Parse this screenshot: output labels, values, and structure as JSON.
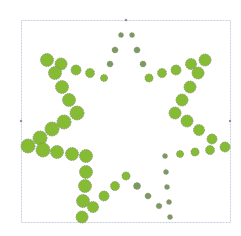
{
  "chart_data": {
    "type": "scatter",
    "title": "",
    "xlabel": "",
    "ylabel": "",
    "grid": false,
    "legend": false,
    "frame": {
      "x": 21,
      "y": 20,
      "width": 209,
      "height": 202,
      "color": "#c8cce0"
    },
    "ticks": [
      {
        "x": 126,
        "y": 20
      },
      {
        "x": 21,
        "y": 121
      },
      {
        "x": 230,
        "y": 121
      }
    ],
    "colors": {
      "large_fill": "#86bc34",
      "large_stroke": "#7a8a6a",
      "small_fill": "#7c9a5a",
      "small_stroke": "#8a8a9a"
    },
    "series": [
      {
        "name": "large",
        "points": [
          {
            "x": 47,
            "y": 60,
            "r": 6.5
          },
          {
            "x": 61,
            "y": 64,
            "r": 6
          },
          {
            "x": 55,
            "y": 73,
            "r": 6.5
          },
          {
            "x": 76,
            "y": 70,
            "r": 5
          },
          {
            "x": 90,
            "y": 73,
            "r": 4.5
          },
          {
            "x": 62,
            "y": 87,
            "r": 6.5
          },
          {
            "x": 69,
            "y": 100,
            "r": 6.5
          },
          {
            "x": 77,
            "y": 113,
            "r": 7
          },
          {
            "x": 64,
            "y": 122,
            "r": 7
          },
          {
            "x": 52,
            "y": 129,
            "r": 7
          },
          {
            "x": 40,
            "y": 138,
            "r": 7
          },
          {
            "x": 28,
            "y": 146,
            "r": 7
          },
          {
            "x": 43,
            "y": 150,
            "r": 7
          },
          {
            "x": 57,
            "y": 152,
            "r": 6.5
          },
          {
            "x": 72,
            "y": 154,
            "r": 6.5
          },
          {
            "x": 86,
            "y": 156,
            "r": 6.5
          },
          {
            "x": 86,
            "y": 172,
            "r": 6.5
          },
          {
            "x": 85,
            "y": 186,
            "r": 6.5
          },
          {
            "x": 83,
            "y": 201,
            "r": 6.5
          },
          {
            "x": 93,
            "y": 207,
            "r": 5.5
          },
          {
            "x": 82,
            "y": 217,
            "r": 6
          },
          {
            "x": 104,
            "y": 196,
            "r": 5
          },
          {
            "x": 115,
            "y": 186,
            "r": 4.5
          },
          {
            "x": 126,
            "y": 176,
            "r": 4
          },
          {
            "x": 205,
            "y": 60,
            "r": 6
          },
          {
            "x": 191,
            "y": 64,
            "r": 5.5
          },
          {
            "x": 198,
            "y": 73,
            "r": 6
          },
          {
            "x": 176,
            "y": 70,
            "r": 5
          },
          {
            "x": 162,
            "y": 73,
            "r": 4.5
          },
          {
            "x": 149,
            "y": 78,
            "r": 4
          },
          {
            "x": 190,
            "y": 87,
            "r": 6
          },
          {
            "x": 182,
            "y": 100,
            "r": 6
          },
          {
            "x": 175,
            "y": 113,
            "r": 6
          },
          {
            "x": 187,
            "y": 121,
            "r": 6
          },
          {
            "x": 199,
            "y": 130,
            "r": 5.5
          },
          {
            "x": 212,
            "y": 139,
            "r": 5
          },
          {
            "x": 225,
            "y": 147,
            "r": 5
          },
          {
            "x": 210,
            "y": 150,
            "r": 4.5
          },
          {
            "x": 195,
            "y": 152,
            "r": 4
          },
          {
            "x": 180,
            "y": 154,
            "r": 3.5
          },
          {
            "x": 104,
            "y": 78,
            "r": 3.5
          }
        ]
      },
      {
        "name": "small",
        "points": [
          {
            "x": 121,
            "y": 35,
            "r": 2.5
          },
          {
            "x": 132,
            "y": 35,
            "r": 2.5
          },
          {
            "x": 115,
            "y": 50,
            "r": 3
          },
          {
            "x": 137,
            "y": 50,
            "r": 3
          },
          {
            "x": 110,
            "y": 64,
            "r": 3
          },
          {
            "x": 143,
            "y": 64,
            "r": 3
          },
          {
            "x": 137,
            "y": 186,
            "r": 3.5
          },
          {
            "x": 148,
            "y": 196,
            "r": 3
          },
          {
            "x": 159,
            "y": 206,
            "r": 2.8
          },
          {
            "x": 170,
            "y": 217,
            "r": 2.5
          },
          {
            "x": 169,
            "y": 202,
            "r": 2.5
          },
          {
            "x": 167,
            "y": 187,
            "r": 2.5
          },
          {
            "x": 166,
            "y": 172,
            "r": 2.5
          },
          {
            "x": 165,
            "y": 156,
            "r": 2.5
          }
        ]
      }
    ]
  }
}
